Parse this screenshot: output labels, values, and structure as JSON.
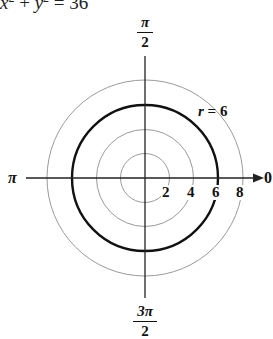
{
  "equation": {
    "lhs_x": "x",
    "exp1": "2",
    "plus": " + ",
    "lhs_y": "y",
    "exp2": "2",
    "rhs": " = 36"
  },
  "axes": {
    "top_label": {
      "numerator": "π",
      "denominator": "2"
    },
    "bottom_label": {
      "numerator": "3π",
      "denominator": "2"
    },
    "left_label": "π",
    "right_label": "0"
  },
  "ticks": [
    "2",
    "4",
    "6",
    "8"
  ],
  "curve_label": "r = 6",
  "colors": {
    "grid_circle": "#9a9a9a",
    "highlight_circle": "#111111",
    "axis": "#222222"
  },
  "chart_data": {
    "type": "polar",
    "grid_radii": [
      2,
      4,
      6,
      8
    ],
    "highlighted_curve": {
      "equation": "r = 6",
      "radius": 6
    },
    "angle_labels": [
      "0",
      "π/2",
      "π",
      "3π/2"
    ],
    "radial_tick_labels": [
      "2",
      "4",
      "6",
      "8"
    ]
  }
}
